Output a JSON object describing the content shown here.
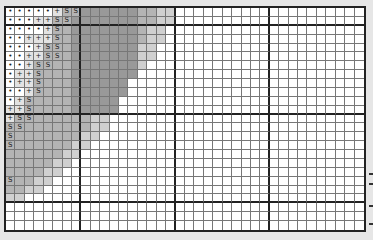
{
  "grid": {
    "columns": 38,
    "rows": 25,
    "thick_column_lines_after": [
      7,
      17,
      27
    ],
    "thick_row_lines_after": [
      1,
      11,
      21
    ],
    "line_color": "#777777",
    "thick_line_color": "#222222",
    "background": "#ffffff"
  },
  "symbols": {
    "dot": "•",
    "plus": "+",
    "s": "S"
  },
  "shade_colors": {
    "light": "#d0d0d0",
    "mid": "#b4b4b4",
    "dark": "#999999"
  },
  "rows": [
    {
      "marks": [
        "dot",
        "dot",
        "dot",
        "dot",
        "dot",
        "plus",
        "s",
        "s"
      ],
      "shaded_to": 17
    },
    {
      "marks": [
        "dot",
        "dot",
        "dot",
        "plus",
        "plus",
        "s",
        "s"
      ],
      "shaded_to": 17
    },
    {
      "marks": [
        "dot",
        "dot",
        "dot",
        "dot",
        "plus",
        "s"
      ],
      "shaded_to": 16
    },
    {
      "marks": [
        "dot",
        "dot",
        "plus",
        "plus",
        "plus",
        "s"
      ],
      "shaded_to": 16
    },
    {
      "marks": [
        "dot",
        "dot",
        "dot",
        "plus",
        "s",
        "s"
      ],
      "shaded_to": 15
    },
    {
      "marks": [
        "dot",
        "dot",
        "plus",
        "plus",
        "s",
        "s"
      ],
      "shaded_to": 15
    },
    {
      "marks": [
        "dot",
        "dot",
        "plus",
        "s",
        "s"
      ],
      "shaded_to": 14
    },
    {
      "marks": [
        "dot",
        "plus",
        "plus",
        "s"
      ],
      "shaded_to": 13
    },
    {
      "marks": [
        "dot",
        "plus",
        "plus",
        "s"
      ],
      "shaded_to": 12
    },
    {
      "marks": [
        "dot",
        "dot",
        "plus",
        "s"
      ],
      "shaded_to": 12
    },
    {
      "marks": [
        "dot",
        "plus",
        "s"
      ],
      "shaded_to": 11
    },
    {
      "marks": [
        "plus",
        "plus",
        "s"
      ],
      "shaded_to": 11
    },
    {
      "marks": [
        "plus",
        "s",
        "s"
      ],
      "shaded_to": 10
    },
    {
      "marks": [
        "s",
        "s"
      ],
      "shaded_to": 10
    },
    {
      "marks": [
        "s"
      ],
      "shaded_to": 9
    },
    {
      "marks": [
        "s"
      ],
      "shaded_to": 8
    },
    {
      "marks": [],
      "shaded_to": 7
    },
    {
      "marks": [],
      "shaded_to": 6
    },
    {
      "marks": [],
      "shaded_to": 5
    },
    {
      "marks": [
        "s"
      ],
      "shaded_to": 4
    },
    {
      "marks": [],
      "shaded_to": 3
    },
    {
      "marks": [],
      "shaded_to": 1
    },
    {
      "marks": [],
      "shaded_to": -1
    },
    {
      "marks": [],
      "shaded_to": -1
    },
    {
      "marks": [],
      "shaded_to": -1
    }
  ],
  "side_marks_y": [
    173,
    183,
    205,
    223
  ]
}
